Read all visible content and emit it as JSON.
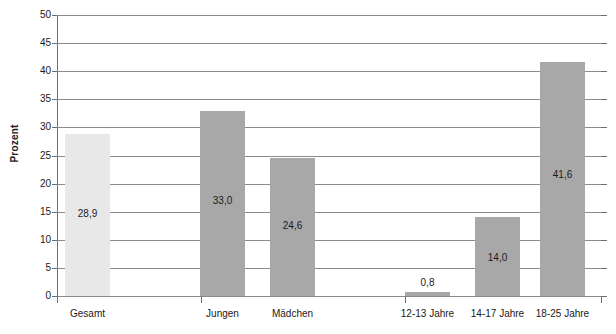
{
  "chart_data": {
    "type": "bar",
    "title": "",
    "subtitle": "",
    "xlabel": "",
    "ylabel": "Prozent",
    "ylim": [
      0,
      50
    ],
    "ytick_step": 5,
    "yticks": [
      "50",
      "45",
      "40",
      "35",
      "30",
      "25",
      "20",
      "15",
      "10",
      "5",
      "0"
    ],
    "grid": true,
    "legend": "none",
    "value_label_format": "comma-decimal",
    "categories": [
      "Gesamt",
      "Jungen",
      "Mädchen",
      "12-13 Jahre",
      "14-17 Jahre",
      "18-25 Jahre"
    ],
    "values": [
      28.9,
      33.0,
      24.6,
      0.8,
      14.0,
      41.6
    ],
    "value_labels": [
      "28,9",
      "33,0",
      "24,6",
      "0,8",
      "14,0",
      "41,6"
    ],
    "bar_colors": [
      "#e8e8e8",
      "#a8a8a8",
      "#a8a8a8",
      "#a8a8a8",
      "#a8a8a8",
      "#a8a8a8"
    ],
    "groups": [
      {
        "name": "Gesamt",
        "categories": [
          "Gesamt"
        ]
      },
      {
        "name": "Geschlecht",
        "categories": [
          "Jungen",
          "Mädchen"
        ]
      },
      {
        "name": "Alter",
        "categories": [
          "12-13 Jahre",
          "14-17 Jahre",
          "18-25 Jahre"
        ]
      }
    ]
  },
  "colors": {
    "bar_light": "#e8e8e8",
    "bar_dark": "#a8a8a8",
    "gridline": "#8c8c8c",
    "axis": "#6f6f6f",
    "text": "#1a1a1a",
    "background": "#ffffff"
  }
}
